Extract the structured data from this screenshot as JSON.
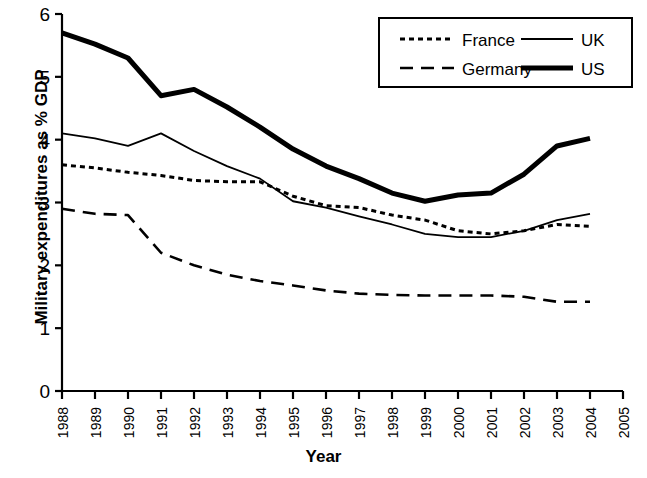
{
  "chart_data": {
    "type": "line",
    "title": "",
    "xlabel": "Year",
    "ylabel": "Military expenditures as % GDP",
    "xlim": [
      1988,
      2005
    ],
    "ylim": [
      0,
      6
    ],
    "y_ticks": [
      0,
      1,
      2,
      3,
      4,
      5,
      6
    ],
    "grid": false,
    "legend_position": "top-right",
    "x": [
      1988,
      1989,
      1990,
      1991,
      1992,
      1993,
      1994,
      1995,
      1996,
      1997,
      1998,
      1999,
      2000,
      2001,
      2002,
      2003,
      2004
    ],
    "categories": [
      "1988",
      "1989",
      "1990",
      "1991",
      "1992",
      "1993",
      "1994",
      "1995",
      "1996",
      "1997",
      "1998",
      "1999",
      "2000",
      "2001",
      "2002",
      "2003",
      "2004"
    ],
    "x_tick_labels": [
      "1988",
      "1989",
      "1990",
      "1991",
      "1992",
      "1993",
      "1994",
      "1995",
      "1996",
      "1997",
      "1998",
      "1999",
      "2000",
      "2001",
      "2002",
      "2003",
      "2004",
      "2005"
    ],
    "series": [
      {
        "name": "France",
        "style": "dotted",
        "values": [
          3.6,
          3.55,
          3.48,
          3.43,
          3.35,
          3.33,
          3.33,
          3.1,
          2.95,
          2.92,
          2.8,
          2.72,
          2.55,
          2.5,
          2.55,
          2.65,
          2.62
        ]
      },
      {
        "name": "Germany",
        "style": "dashed",
        "values": [
          2.9,
          2.82,
          2.8,
          2.2,
          2.0,
          1.85,
          1.75,
          1.68,
          1.6,
          1.55,
          1.53,
          1.52,
          1.52,
          1.52,
          1.5,
          1.42,
          1.42
        ]
      },
      {
        "name": "UK",
        "style": "thin-solid",
        "values": [
          4.1,
          4.02,
          3.9,
          4.1,
          3.82,
          3.58,
          3.38,
          3.02,
          2.92,
          2.78,
          2.65,
          2.5,
          2.45,
          2.45,
          2.55,
          2.72,
          2.82
        ]
      },
      {
        "name": "US",
        "style": "thick-solid",
        "values": [
          5.7,
          5.52,
          5.3,
          4.7,
          4.8,
          4.52,
          4.2,
          3.85,
          3.58,
          3.38,
          3.15,
          3.02,
          3.12,
          3.15,
          3.45,
          3.9,
          4.02
        ]
      }
    ]
  },
  "legend": {
    "entries": [
      {
        "label": "France",
        "style": "dotted"
      },
      {
        "label": "UK",
        "style": "thin-solid"
      },
      {
        "label": "Germany",
        "style": "dashed"
      },
      {
        "label": "US",
        "style": "thick-solid"
      }
    ]
  },
  "colors": {
    "line": "#000000",
    "background": "#ffffff",
    "axis": "#000000"
  }
}
